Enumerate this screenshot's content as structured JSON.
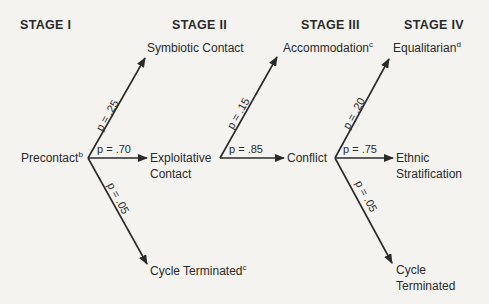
{
  "stages": [
    {
      "label": "STAGE I"
    },
    {
      "label": "STAGE II"
    },
    {
      "label": "STAGE III"
    },
    {
      "label": "STAGE IV"
    }
  ],
  "nodes": {
    "precontact": {
      "label": "Precontact",
      "sup": "b"
    },
    "symbiotic": {
      "label": "Symbiotic Contact"
    },
    "exploitative": {
      "label1": "Exploitative",
      "label2": "Contact"
    },
    "terminated1": {
      "label": "Cycle Terminated",
      "sup": "c"
    },
    "accommodation": {
      "label": "Accommodation",
      "sup": "c"
    },
    "conflict": {
      "label": "Conflict"
    },
    "equalitarian": {
      "label": "Equalitarian",
      "sup": "d"
    },
    "ethnic": {
      "label1": "Ethnic",
      "label2": "Stratification"
    },
    "terminated2": {
      "label1": "Cycle",
      "label2": "Terminated"
    }
  },
  "edges": [
    {
      "from": "Precontact",
      "to": "Symbiotic Contact",
      "p": "p = .25"
    },
    {
      "from": "Precontact",
      "to": "Exploitative Contact",
      "p": "p = .70"
    },
    {
      "from": "Precontact",
      "to": "Cycle Terminated",
      "p": "p = .05"
    },
    {
      "from": "Exploitative Contact",
      "to": "Accommodation",
      "p": "p = .15"
    },
    {
      "from": "Exploitative Contact",
      "to": "Conflict",
      "p": "p = .85"
    },
    {
      "from": "Conflict",
      "to": "Equalitarian",
      "p": "p = .20"
    },
    {
      "from": "Conflict",
      "to": "Ethnic Stratification",
      "p": "p = .75"
    },
    {
      "from": "Conflict",
      "to": "Cycle Terminated",
      "p": "p = .05"
    }
  ]
}
